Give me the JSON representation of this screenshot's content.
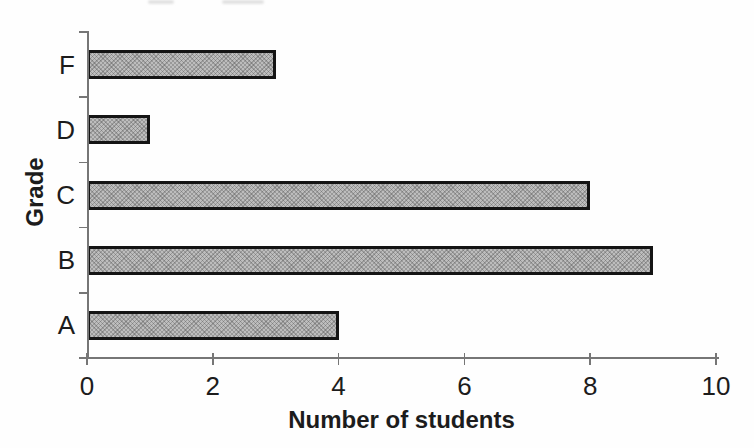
{
  "chart_data": {
    "type": "bar",
    "orientation": "horizontal",
    "categories": [
      "F",
      "D",
      "C",
      "B",
      "A"
    ],
    "values": [
      3,
      1,
      8,
      9,
      4
    ],
    "title": "",
    "xlabel": "Number of students",
    "ylabel": "Grade",
    "xlim": [
      0,
      10
    ],
    "xticks": [
      0,
      2,
      4,
      6,
      8,
      10
    ],
    "grid": false,
    "legend": false,
    "colors": {
      "bar_fill": "#bdbdbd",
      "bar_border": "#141414",
      "axis": "#767676",
      "text": "#1c1c1c",
      "background": "#fefefe"
    }
  }
}
